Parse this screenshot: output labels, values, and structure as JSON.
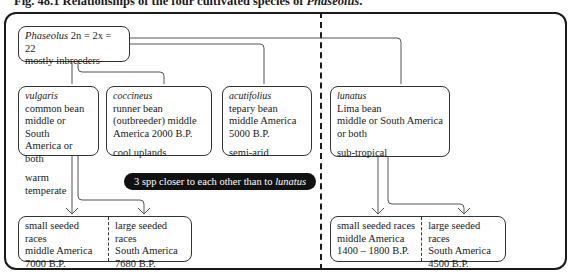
{
  "caption": {
    "prefix": "Fig. 48.1 Relationships of the four cultivated species of ",
    "genus": "Phaseolus",
    "suffix": "."
  },
  "root": {
    "genus": "Phaseolus",
    "formula": " 2n = 2x = 22",
    "note": "mostly inbreeders"
  },
  "species": [
    {
      "name": "vulgaris",
      "lines": [
        "common bean",
        "middle or South",
        "America or both"
      ],
      "climate": "warm temperate"
    },
    {
      "name": "coccineus",
      "lines": [
        "runner bean",
        "(outbreeder) middle",
        "America  2000 B.P."
      ],
      "climate": "cool uplands"
    },
    {
      "name": "acutifolius",
      "lines": [
        "tepary bean",
        "middle America",
        "5000 B.P."
      ],
      "climate": "semi-arid"
    },
    {
      "name": "lunatus",
      "lines": [
        "Lima bean",
        "middle or South America",
        "or both"
      ],
      "climate": "sub-tropical"
    }
  ],
  "note_pill": {
    "text": "3 spp closer to each other than to ",
    "species": "lunatus"
  },
  "races": {
    "vulgaris": [
      {
        "lines": [
          "small seeded races",
          "middle America",
          "7000 B.P."
        ]
      },
      {
        "lines": [
          "large seeded races",
          "South America",
          "7680 B.P."
        ]
      }
    ],
    "lunatus": [
      {
        "lines": [
          "small seeded races",
          "middle America",
          "1400 – 1800 B.P."
        ]
      },
      {
        "lines": [
          "large seeded races",
          "South America",
          "4500 B.P."
        ]
      }
    ]
  },
  "colors": {
    "ink": "#1a1a1a",
    "line": "#555555",
    "pill_bg": "#111111",
    "pill_text": "#ffffff"
  }
}
